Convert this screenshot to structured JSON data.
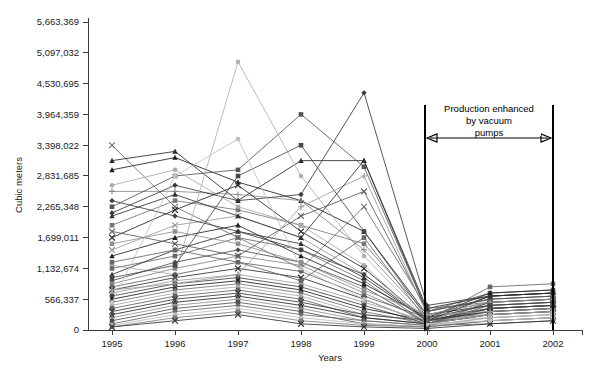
{
  "chart_data": {
    "type": "line",
    "title": "",
    "subtitle": "",
    "xlabel": "Years",
    "ylabel": "Cubic meters",
    "grid": false,
    "legend_position": "none",
    "x": [
      1995,
      1996,
      1997,
      1998,
      1999,
      2000,
      2001,
      2002
    ],
    "categories": [
      "1995",
      "1996",
      "1997",
      "1998",
      "1999",
      "2000",
      "2001",
      "2002"
    ],
    "xtick_labels": [
      "1995",
      "1996",
      "1997",
      "1998",
      "1999",
      "2000",
      "2001",
      "2002"
    ],
    "ytick_labels": [
      "0",
      "566,337",
      "1,132,674",
      "1,699,011",
      "2,265,348",
      "2,831,685",
      "3,398,022",
      "3,964,359",
      "4,530,695",
      "5,097,032",
      "5,663,369"
    ],
    "ytick_values": [
      0,
      566337,
      1132674,
      1699011,
      2265348,
      2831685,
      3398022,
      3964359,
      4530695,
      5097032,
      5663369
    ],
    "ylim": [
      0,
      5663369
    ],
    "xlim": [
      1995,
      2002
    ],
    "annotations": [
      {
        "name": "production-enhanced-note",
        "text_lines": [
          "Production enhanced",
          "by vacuum",
          "pumps"
        ],
        "span_from": 2000,
        "span_to": 2002,
        "style": "double-headed-arrow-between-vertical-lines"
      }
    ],
    "series": [
      {
        "name": "S01",
        "marker": "x",
        "color": "#6e6e6e",
        "values": [
          3398022,
          2265348,
          1699011,
          1132674,
          2265348,
          396435,
          509703,
          566337
        ]
      },
      {
        "name": "S02",
        "marker": "triangle",
        "color": "#2b2b2b",
        "values": [
          3114687,
          3284358,
          2378482,
          3114687,
          3114687,
          339802,
          566337,
          622970
        ]
      },
      {
        "name": "S03",
        "marker": "triangle",
        "color": "#1f1f1f",
        "values": [
          2944916,
          3171023,
          2718700,
          2378482,
          1812064,
          283168,
          452669,
          509703
        ]
      },
      {
        "name": "S04",
        "marker": "plus",
        "color": "#8a8a8a",
        "values": [
          2548481,
          2548481,
          2491847,
          2378482,
          1472904,
          226534,
          396435,
          452669
        ]
      },
      {
        "name": "S05",
        "marker": "square",
        "color": "#555555",
        "values": [
          2265348,
          2831685,
          2944916,
          3964359,
          3001550,
          339802,
          679604,
          735937
        ]
      },
      {
        "name": "S06",
        "marker": "diamond",
        "color": "#3a3a3a",
        "values": [
          2151982,
          2661847,
          2378482,
          2491847,
          4360794,
          452669,
          622970,
          679604
        ]
      },
      {
        "name": "S07",
        "marker": "square",
        "color": "#777777",
        "values": [
          1925876,
          2378482,
          2208665,
          1925876,
          1585658,
          283168,
          509703,
          566337
        ]
      },
      {
        "name": "S08",
        "marker": "x",
        "color": "#242424",
        "values": [
          1699011,
          2208665,
          2661847,
          1812064,
          1132674,
          169901,
          339802,
          396435
        ]
      },
      {
        "name": "S09",
        "marker": "x",
        "color": "#9a9a9a",
        "values": [
          1472904,
          1925876,
          2095299,
          1699011,
          1019407,
          226534,
          283168,
          339802
        ]
      },
      {
        "name": "S10",
        "marker": "circle",
        "color": "#b0b0b0",
        "values": [
          1189307,
          1019407,
          4930000,
          2831685,
          1359539,
          169901,
          226534,
          283168
        ]
      },
      {
        "name": "S11",
        "marker": "square",
        "color": "#6a6a6a",
        "values": [
          1132674,
          1359539,
          1699011,
          1472904,
          906139,
          113267,
          339802,
          396435
        ]
      },
      {
        "name": "S12",
        "marker": "triangle",
        "color": "#333333",
        "values": [
          1019407,
          1472904,
          1812064,
          1585658,
          962772,
          169901,
          396435,
          452669
        ]
      },
      {
        "name": "S13",
        "marker": "diamond",
        "color": "#4a4a4a",
        "values": [
          906139,
          1246174,
          1472904,
          1246174,
          792772,
          113267,
          283168,
          339802
        ]
      },
      {
        "name": "S14",
        "marker": "square",
        "color": "#858585",
        "values": [
          849506,
          1132674,
          1359539,
          1189307,
          679604,
          169901,
          509703,
          566337
        ]
      },
      {
        "name": "S15",
        "marker": "circle",
        "color": "#5e5e5e",
        "values": [
          792772,
          1019407,
          1246174,
          1076041,
          622970,
          226534,
          622970,
          679604
        ]
      },
      {
        "name": "S16",
        "marker": "x",
        "color": "#2e2e2e",
        "values": [
          736139,
          962772,
          1132674,
          962772,
          566337,
          113267,
          396435,
          452669
        ]
      },
      {
        "name": "S17",
        "marker": "plus",
        "color": "#9e9e9e",
        "values": [
          679604,
          906139,
          1019407,
          849506,
          509703,
          169901,
          283168,
          339802
        ]
      },
      {
        "name": "S18",
        "marker": "square",
        "color": "#444444",
        "values": [
          622970,
          849506,
          962772,
          792772,
          452669,
          113267,
          509703,
          566337
        ]
      },
      {
        "name": "S19",
        "marker": "triangle",
        "color": "#1a1a1a",
        "values": [
          566337,
          792772,
          906139,
          736139,
          396435,
          169901,
          622970,
          679604
        ]
      },
      {
        "name": "S20",
        "marker": "diamond",
        "color": "#707070",
        "values": [
          509703,
          736139,
          849506,
          679604,
          339802,
          113267,
          396435,
          452669
        ]
      },
      {
        "name": "S21",
        "marker": "circle",
        "color": "#a8a8a8",
        "values": [
          452669,
          679604,
          792772,
          622970,
          283168,
          169901,
          283168,
          339802
        ]
      },
      {
        "name": "S22",
        "marker": "square",
        "color": "#606060",
        "values": [
          396435,
          622970,
          736139,
          566337,
          226534,
          113267,
          452669,
          509703
        ]
      },
      {
        "name": "S23",
        "marker": "x",
        "color": "#383838",
        "values": [
          339802,
          566337,
          679604,
          509703,
          283168,
          169901,
          339802,
          396435
        ]
      },
      {
        "name": "S24",
        "marker": "triangle",
        "color": "#282828",
        "values": [
          283168,
          509703,
          622970,
          452669,
          226534,
          113267,
          283168,
          339802
        ]
      },
      {
        "name": "S25",
        "marker": "plus",
        "color": "#8f8f8f",
        "values": [
          226534,
          452669,
          566337,
          396435,
          169901,
          84950,
          226534,
          283168
        ]
      },
      {
        "name": "S26",
        "marker": "square",
        "color": "#505050",
        "values": [
          169901,
          396435,
          509703,
          339802,
          113267,
          56633,
          169901,
          226534
        ]
      },
      {
        "name": "S27",
        "marker": "diamond",
        "color": "#696969",
        "values": [
          113267,
          339802,
          452669,
          283168,
          169901,
          84950,
          113267,
          169901
        ]
      },
      {
        "name": "S28",
        "marker": "circle",
        "color": "#bdbdbd",
        "values": [
          84950,
          283168,
          396435,
          226534,
          113267,
          56633,
          226534,
          283168
        ]
      },
      {
        "name": "S29",
        "marker": "square",
        "color": "#7c7c7c",
        "values": [
          56633,
          226534,
          339802,
          169901,
          84950,
          56633,
          169901,
          226534
        ]
      },
      {
        "name": "S30",
        "marker": "x",
        "color": "#343434",
        "values": [
          56633,
          169901,
          283168,
          113267,
          56633,
          28316,
          113267,
          169901
        ]
      },
      {
        "name": "S31",
        "marker": "triangle",
        "color": "#222222",
        "values": [
          1359539,
          1699011,
          1925876,
          1359539,
          849506,
          226534,
          679604,
          736139
        ]
      },
      {
        "name": "S32",
        "marker": "square",
        "color": "#909090",
        "values": [
          1585658,
          1812064,
          1585658,
          1246174,
          736139,
          283168,
          509703,
          566337
        ]
      },
      {
        "name": "S33",
        "marker": "diamond",
        "color": "#3f3f3f",
        "values": [
          2378482,
          2095299,
          1812064,
          1472904,
          1019407,
          169901,
          396435,
          452669
        ]
      },
      {
        "name": "S34",
        "marker": "circle",
        "color": "#aaaaaa",
        "values": [
          2661847,
          2944916,
          2265348,
          1925876,
          1189307,
          113267,
          283168,
          339802
        ]
      },
      {
        "name": "S35",
        "marker": "x",
        "color": "#5a5a5a",
        "values": [
          1812064,
          1585658,
          1359539,
          2095299,
          2548481,
          339802,
          566337,
          622970
        ]
      },
      {
        "name": "S36",
        "marker": "square",
        "color": "#474747",
        "values": [
          962772,
          1189307,
          2831685,
          3398022,
          1812064,
          226534,
          452669,
          509703
        ]
      },
      {
        "name": "S37",
        "marker": "plus",
        "color": "#999999",
        "values": [
          736139,
          849506,
          1019407,
          2265348,
          2831685,
          283168,
          339802,
          396435
        ]
      },
      {
        "name": "S38",
        "marker": "triangle",
        "color": "#303030",
        "values": [
          2095299,
          2491847,
          2095299,
          1699011,
          3114687,
          396435,
          622970,
          679604
        ]
      },
      {
        "name": "S39",
        "marker": "circle",
        "color": "#c0c0c0",
        "values": [
          509703,
          2831685,
          3511387,
          1132674,
          566337,
          113267,
          169901,
          226534
        ]
      },
      {
        "name": "S40",
        "marker": "square",
        "color": "#666666",
        "values": [
          1246174,
          1472904,
          1246174,
          906139,
          1699011,
          169901,
          792772,
          849506
        ]
      }
    ]
  },
  "axes": {
    "y_axis_label": "Cubic meters",
    "x_axis_label": "Years"
  }
}
